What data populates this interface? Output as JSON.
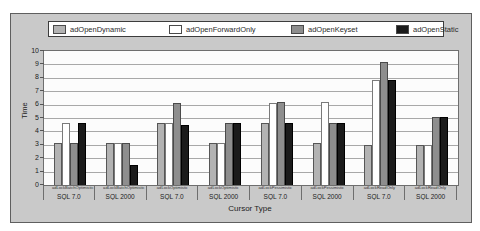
{
  "colors": {
    "page_background": "#ffffff",
    "panel_background": "#c9c9c9",
    "plot_background": "#fcfcfc",
    "gridline": "#a8a8a8",
    "axis_text": "#222222"
  },
  "chart_data": {
    "type": "bar",
    "title": "",
    "xlabel": "Cursor Type",
    "ylabel": "Time",
    "ylim": [
      0,
      10
    ],
    "ytick_step": 1,
    "ytick_labels": [
      "0",
      "1",
      "2",
      "3",
      "4",
      "5",
      "6",
      "7",
      "8",
      "9",
      "10"
    ],
    "grid": "horizontal",
    "legend_position": "top",
    "categories": [
      {
        "lock_type": "adLockBatchOptimistic",
        "sql": "SQL 7.0"
      },
      {
        "lock_type": "adLockBatchOptimistic",
        "sql": "SQL 2000"
      },
      {
        "lock_type": "adLockOptimistic",
        "sql": "SQL 7.0"
      },
      {
        "lock_type": "adLockOptimistic",
        "sql": "SQL 2000"
      },
      {
        "lock_type": "adLockPessimistic",
        "sql": "SQL 7.0"
      },
      {
        "lock_type": "adLockPessimistic",
        "sql": "SQL 2000"
      },
      {
        "lock_type": "adLockReadOnly",
        "sql": "SQL 7.0"
      },
      {
        "lock_type": "adLockReadOnly",
        "sql": "SQL 2000"
      }
    ],
    "series": [
      {
        "name": "adOpenDynamic",
        "color": "#b3b3b3",
        "border": "#565656",
        "values": [
          3.1,
          3.1,
          4.6,
          3.1,
          4.6,
          3.1,
          3.0,
          3.0
        ]
      },
      {
        "name": "adOpenForwardOnly",
        "color": "#ffffff",
        "border": "#7a7a7a",
        "values": [
          4.6,
          3.1,
          4.6,
          3.1,
          6.1,
          6.2,
          7.8,
          3.0
        ]
      },
      {
        "name": "adOpenKeyset",
        "color": "#8e8e8e",
        "border": "#4a4a4a",
        "values": [
          3.1,
          3.1,
          6.1,
          4.6,
          6.2,
          4.6,
          9.2,
          5.1
        ]
      },
      {
        "name": "adOpenStatic",
        "color": "#1b1b1b",
        "border": "#000000",
        "values": [
          4.6,
          1.5,
          4.5,
          4.6,
          4.6,
          4.6,
          7.8,
          5.1
        ]
      }
    ],
    "legend_item_offsets_px": [
      4,
      120,
      242,
      347
    ]
  }
}
